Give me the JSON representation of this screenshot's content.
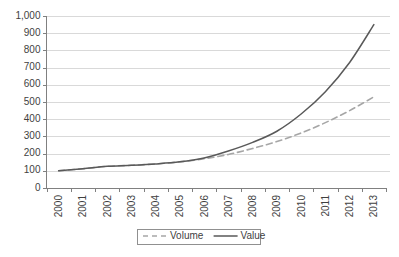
{
  "chart_data": {
    "type": "line",
    "title": "",
    "subtitle": "",
    "xlabel": "",
    "ylabel": "",
    "categories": [
      "2000",
      "2001",
      "2002",
      "2003",
      "2004",
      "2005",
      "2006",
      "2007",
      "2008",
      "2009",
      "2010",
      "2011",
      "2012",
      "2013"
    ],
    "x": [
      2000,
      2001,
      2002,
      2003,
      2004,
      2005,
      2006,
      2007,
      2008,
      2009,
      2010,
      2011,
      2012,
      2013
    ],
    "series": [
      {
        "name": "Volume",
        "style": "dashed",
        "color": "#a6a6a6",
        "values": [
          100,
          112,
          126,
          132,
          140,
          152,
          170,
          195,
          230,
          270,
          320,
          380,
          450,
          530
        ]
      },
      {
        "name": "Value",
        "style": "solid",
        "color": "#595959",
        "values": [
          100,
          112,
          126,
          132,
          140,
          152,
          175,
          215,
          265,
          330,
          430,
          560,
          730,
          950
        ]
      }
    ],
    "ylim": [
      0,
      1000
    ],
    "yticks": [
      0,
      100,
      200,
      300,
      400,
      500,
      600,
      700,
      800,
      900,
      1000
    ],
    "ytick_labels": [
      "0",
      "100",
      "200",
      "300",
      "400",
      "500",
      "600",
      "700",
      "800",
      "900",
      "1,000"
    ],
    "grid": {
      "horizontal": true,
      "vertical": false,
      "color": "#d9d9d9"
    },
    "legend": {
      "position": "bottom-center",
      "bordered": true,
      "entries": [
        {
          "label": "Volume",
          "style": "dashed",
          "color": "#a6a6a6"
        },
        {
          "label": "Value",
          "style": "solid",
          "color": "#595959"
        }
      ]
    },
    "axis": {
      "line_color": "#808080",
      "xtick_rotation": -90
    },
    "background": "#ffffff"
  }
}
